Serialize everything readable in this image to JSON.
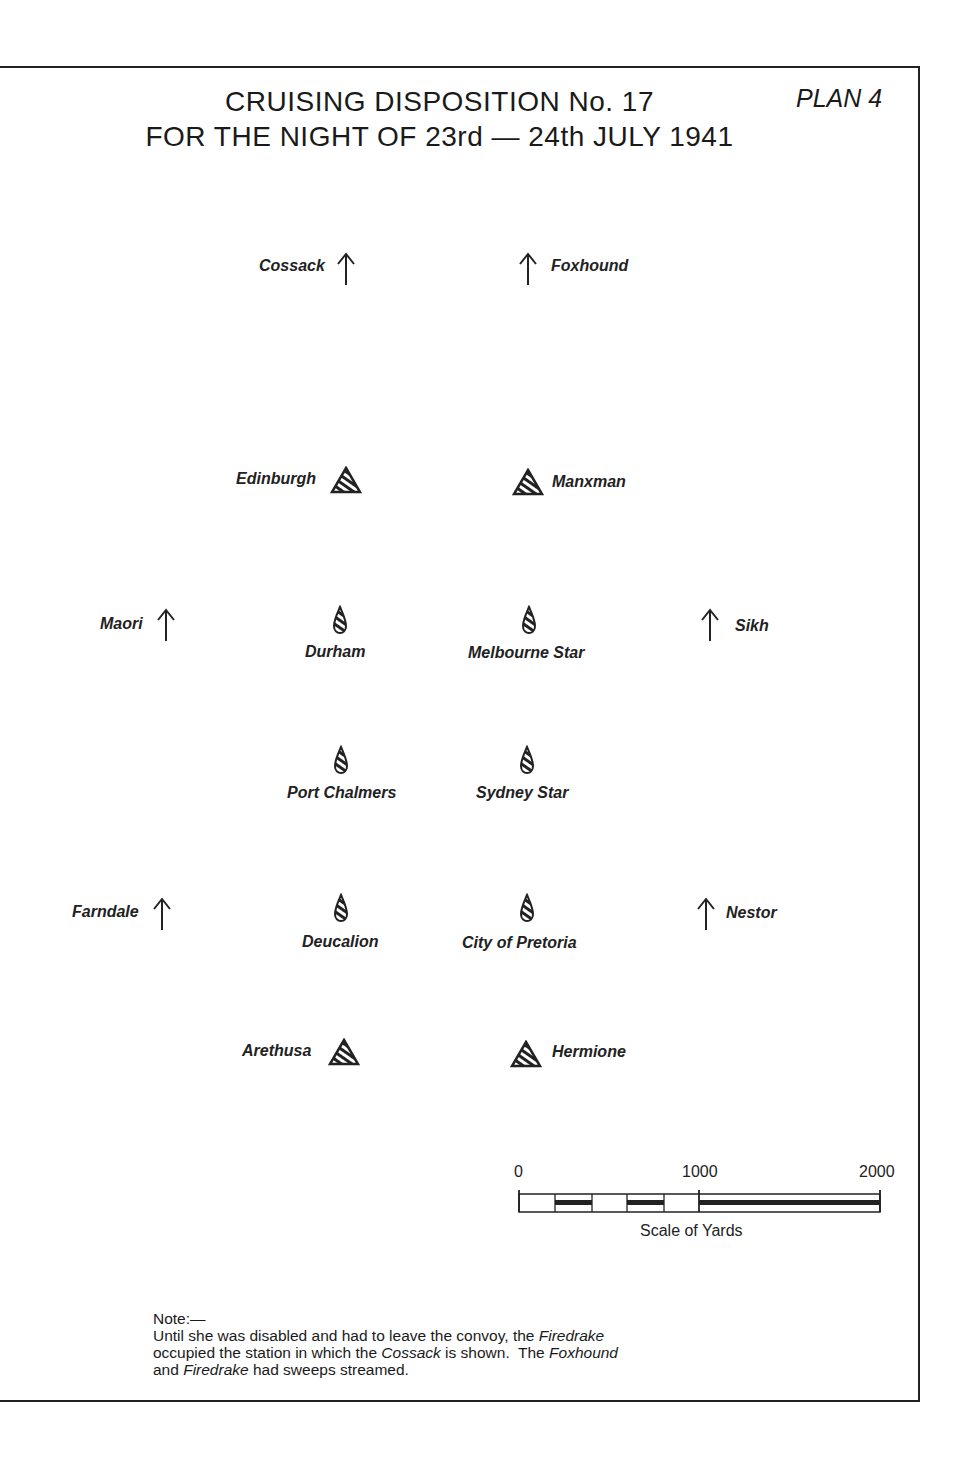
{
  "title": {
    "line1": "CRUISING DISPOSITION No. 17",
    "line2": "FOR THE NIGHT OF 23rd — 24th JULY 1941",
    "plan": "PLAN 4"
  },
  "legend_symbols": {
    "destroyer": "arrow-up-icon",
    "cruiser": "hatched-triangle-icon",
    "merchant": "hatched-teardrop-icon"
  },
  "ships": [
    {
      "name": "Cossack",
      "type": "destroyer"
    },
    {
      "name": "Foxhound",
      "type": "destroyer"
    },
    {
      "name": "Edinburgh",
      "type": "cruiser"
    },
    {
      "name": "Manxman",
      "type": "cruiser"
    },
    {
      "name": "Maori",
      "type": "destroyer"
    },
    {
      "name": "Durham",
      "type": "merchant"
    },
    {
      "name": "Melbourne Star",
      "type": "merchant"
    },
    {
      "name": "Sikh",
      "type": "destroyer"
    },
    {
      "name": "Port Chalmers",
      "type": "merchant"
    },
    {
      "name": "Sydney Star",
      "type": "merchant"
    },
    {
      "name": "Farndale",
      "type": "destroyer"
    },
    {
      "name": "Deucalion",
      "type": "merchant"
    },
    {
      "name": "City of Pretoria",
      "type": "merchant"
    },
    {
      "name": "Nestor",
      "type": "destroyer"
    },
    {
      "name": "Arethusa",
      "type": "cruiser"
    },
    {
      "name": "Hermione",
      "type": "cruiser"
    }
  ],
  "scale": {
    "ticks": [
      "0",
      "1000",
      "2000"
    ],
    "caption": "Scale of Yards"
  },
  "note": {
    "heading": "Note:—",
    "line1_a": "Until she was disabled and had to leave the convoy, the ",
    "line1_b": "Firedrake",
    "line2_a": "occupied the station in which the ",
    "line2_b": "Cossack",
    "line2_c": " is shown.  The ",
    "line2_d": "Foxhound",
    "line3_a": "and ",
    "line3_b": "Firedrake",
    "line3_c": " had sweeps streamed."
  }
}
